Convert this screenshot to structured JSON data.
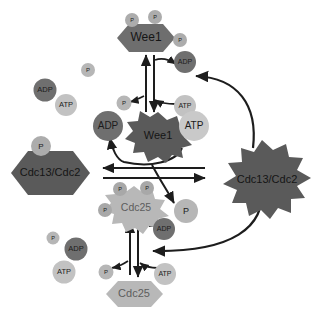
{
  "diagram": {
    "background_color": "#ffffff"
  },
  "colors": {
    "dark_gray": "#5a5a5a",
    "mid_gray": "#6e6e6e",
    "light_gray": "#b8b8b8",
    "pale_gray": "#c9c9c9",
    "adp_gray": "#6f6f6f",
    "atp_gray": "#c2c2c2",
    "p_gray": "#b0b0b0",
    "arrow": "#1d1d1d",
    "text_dark": "#1b1b1b",
    "text_light": "#5d5d5d"
  },
  "nodes": {
    "wee1_inactive": {
      "label": "Wee1",
      "shape": "hexagon",
      "state": "phosphorylated-inactive",
      "color": "#6e6e6e",
      "phosphates": [
        "P",
        "P",
        "P"
      ]
    },
    "wee1_active": {
      "label": "Wee1",
      "shape": "starburst",
      "state": "active",
      "color": "#5a5a5a",
      "phosphates": []
    },
    "cdc25_inactive": {
      "label": "Cdc25",
      "shape": "hexagon",
      "state": "inactive",
      "color": "#b8b8b8",
      "phosphates": []
    },
    "cdc25_active": {
      "label": "Cdc25",
      "shape": "starburst",
      "state": "phosphorylated-active",
      "color": "#b8b8b8",
      "phosphates": [
        "P",
        "P",
        "P"
      ]
    },
    "cdc13_cdc2_inactive": {
      "label": "Cdc13/Cdc2",
      "shape": "hexagon",
      "state": "phosphorylated-inactive",
      "color": "#5a5a5a",
      "phosphates": [
        "P"
      ]
    },
    "cdc13_cdc2_active": {
      "label": "Cdc13/Cdc2",
      "shape": "starburst",
      "state": "active",
      "color": "#5a5a5a",
      "phosphates": []
    }
  },
  "metabolites": {
    "adp_label": "ADP",
    "atp_label": "ATP",
    "p_label": "P",
    "upper_pool": [
      {
        "label": "P",
        "kind": "phosphate"
      },
      {
        "label": "ADP",
        "kind": "adp"
      },
      {
        "label": "ATP",
        "kind": "atp"
      }
    ],
    "lower_pool": [
      {
        "label": "P",
        "kind": "phosphate"
      },
      {
        "label": "ADP",
        "kind": "adp"
      },
      {
        "label": "ATP",
        "kind": "atp"
      }
    ],
    "upper_reaction": [
      {
        "label": "ADP",
        "kind": "adp"
      },
      {
        "label": "ATP",
        "kind": "atp"
      },
      {
        "label": "P",
        "kind": "phosphate"
      }
    ],
    "center_reaction": [
      {
        "label": "ADP",
        "kind": "adp"
      },
      {
        "label": "ATP",
        "kind": "atp"
      },
      {
        "label": "P",
        "kind": "phosphate"
      }
    ],
    "lower_reaction": [
      {
        "label": "ADP",
        "kind": "adp"
      },
      {
        "label": "ATP",
        "kind": "atp"
      },
      {
        "label": "P",
        "kind": "phosphate"
      }
    ]
  }
}
